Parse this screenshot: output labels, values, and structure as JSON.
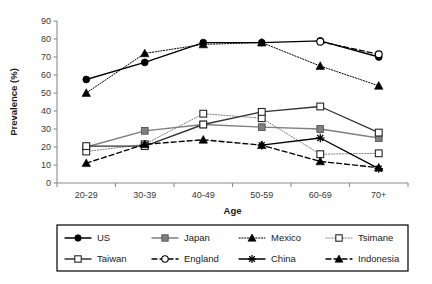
{
  "chart_data": {
    "type": "line",
    "title": "",
    "xlabel": "Age",
    "ylabel": "Prevalence (%)",
    "categories": [
      "20-29",
      "30-39",
      "40-49",
      "50-59",
      "60-69",
      "70+"
    ],
    "ylim": [
      0,
      90
    ],
    "yticks": [
      0,
      10,
      20,
      30,
      40,
      50,
      60,
      70,
      80,
      90
    ],
    "grid": false,
    "legend_position": "bottom",
    "series": [
      {
        "name": "US",
        "marker": "filled-circle",
        "line": "solid",
        "color": "#000000",
        "values": [
          57.5,
          67,
          78,
          78,
          79,
          70
        ]
      },
      {
        "name": "Japan",
        "marker": "filled-square",
        "line": "solid",
        "color": "#7f7f7f",
        "values": [
          20,
          29,
          32.5,
          31,
          30,
          25
        ]
      },
      {
        "name": "Mexico",
        "marker": "filled-triangle",
        "line": "dotted",
        "color": "#000000",
        "values": [
          50,
          72,
          77,
          78,
          65,
          54
        ]
      },
      {
        "name": "Tsimane",
        "marker": "open-square",
        "line": "dotted",
        "color": "#808080",
        "values": [
          17.5,
          21.5,
          38.5,
          36,
          16,
          16.5
        ]
      },
      {
        "name": "Taiwan",
        "marker": "open-square",
        "line": "solid",
        "color": "#333333",
        "values": [
          20.5,
          20.5,
          32.5,
          39.5,
          42.5,
          28
        ]
      },
      {
        "name": "England",
        "marker": "open-circle",
        "line": "dashed",
        "color": "#000000",
        "values": [
          null,
          null,
          null,
          null,
          78.5,
          71.5
        ]
      },
      {
        "name": "China",
        "marker": "asterisk",
        "line": "solid",
        "color": "#000000",
        "values": [
          null,
          null,
          null,
          21,
          25,
          8
        ]
      },
      {
        "name": "Indonesia",
        "marker": "filled-triangle",
        "line": "dashed",
        "color": "#000000",
        "values": [
          11,
          21.5,
          24,
          21,
          12,
          8.5
        ]
      }
    ]
  },
  "legend": {
    "rows": [
      [
        "US",
        "Japan",
        "Mexico",
        "Tsimane"
      ],
      [
        "Taiwan",
        "England",
        "China",
        "Indonesia"
      ]
    ]
  }
}
